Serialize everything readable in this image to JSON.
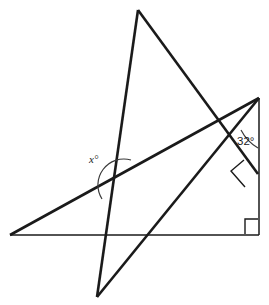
{
  "figure": {
    "type": "geometry-diagram",
    "width": 269,
    "height": 305,
    "background_color": "#ffffff",
    "stroke_color": "#1a1a1a"
  },
  "labels": {
    "unknown_angle": "x°",
    "given_angle": "32°"
  },
  "points": {
    "apex_top": {
      "x": 138,
      "y": 10
    },
    "bottom_spike": {
      "x": 97,
      "y": 297
    },
    "left_base": {
      "x": 10,
      "y": 235
    },
    "right_top": {
      "x": 259,
      "y": 98
    },
    "right_corner": {
      "x": 259,
      "y": 235
    },
    "foot_on_vertical": {
      "x": 258,
      "y": 174
    },
    "cross_x_angle": {
      "x": 112,
      "y": 177
    },
    "cross_upper": {
      "x": 220,
      "y": 123
    },
    "cross_base_left": {
      "x": 104,
      "y": 235
    },
    "cross_base_right": {
      "x": 178,
      "y": 235
    }
  },
  "segments": [
    {
      "name": "triangle-left-side",
      "from": "apex_top",
      "to": "bottom_spike",
      "weight": "thick"
    },
    {
      "name": "triangle-right-side",
      "from": "apex_top",
      "to": "foot_on_vertical",
      "weight": "thick"
    },
    {
      "name": "triangle-bottom-side",
      "from": "bottom_spike",
      "to": "right_top",
      "weight": "thick"
    },
    {
      "name": "transversal-line",
      "from": "left_base",
      "to": "right_top",
      "weight": "thick"
    },
    {
      "name": "horizontal-base-line",
      "from": "left_base",
      "to": "right_corner",
      "weight": "thin"
    },
    {
      "name": "vertical-right-line",
      "from": "right_top",
      "to": "right_corner",
      "weight": "thin"
    }
  ],
  "angle_marks": [
    {
      "name": "x-angle-arc",
      "kind": "arc",
      "at": "cross_x_angle"
    },
    {
      "name": "thirty-two-angle-arc",
      "kind": "arc",
      "at": "right_top_region"
    },
    {
      "name": "right-angle-square-tilted",
      "kind": "square",
      "at": "foot_on_vertical"
    },
    {
      "name": "right-angle-square-corner",
      "kind": "square",
      "at": "right_corner"
    }
  ]
}
